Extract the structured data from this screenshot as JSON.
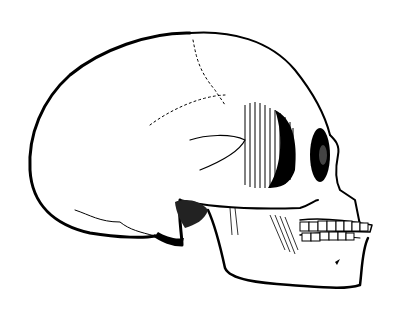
{
  "image": {
    "subject": "skull in profile engraving",
    "orientation": "facing right",
    "style": "black and white line engraving with hatching",
    "colors": {
      "background": "#ffffff",
      "ink": "#000000"
    }
  }
}
